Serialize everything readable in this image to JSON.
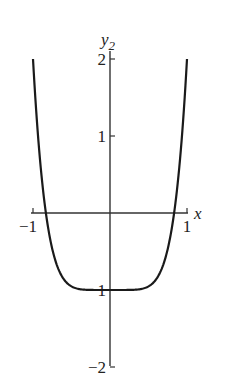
{
  "chart_data": {
    "type": "line",
    "title": "",
    "xlabel": "x",
    "ylabel": "y",
    "ylabel_subscript": "2",
    "xlim": [
      -1,
      1
    ],
    "ylim": [
      -2,
      2
    ],
    "x_ticks": [
      {
        "value": -1,
        "label": "−1"
      },
      {
        "value": 1,
        "label": "1"
      }
    ],
    "y_ticks": [
      {
        "value": 2,
        "label": "2"
      },
      {
        "value": 1,
        "label": "1"
      },
      {
        "value": -1,
        "label": "−1"
      },
      {
        "value": -2,
        "label": "−2"
      }
    ],
    "grid": false,
    "series": [
      {
        "name": "y2",
        "x": [
          -1,
          -0.9,
          -0.8,
          -0.7,
          -0.6,
          -0.5,
          -0.4,
          -0.3,
          -0.2,
          -0.1,
          0,
          0.1,
          0.2,
          0.3,
          0.4,
          0.5,
          0.6,
          0.7,
          0.8,
          0.9,
          1
        ],
        "y": [
          2,
          0.59,
          -0.21,
          -0.65,
          -0.86,
          -0.95,
          -0.99,
          -1.0,
          -1.0,
          -1.0,
          -1,
          -1.0,
          -1.0,
          -1.0,
          -0.99,
          -0.95,
          -0.86,
          -0.65,
          -0.21,
          0.59,
          2
        ],
        "color": "#1a1a1a"
      }
    ]
  }
}
